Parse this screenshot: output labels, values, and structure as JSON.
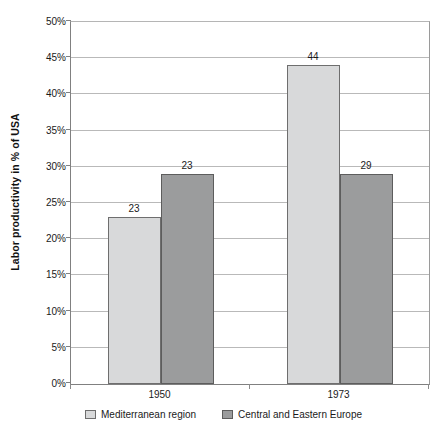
{
  "chart_data": {
    "type": "bar",
    "title": "",
    "subtitle": "",
    "xlabel": "",
    "ylabel": "Labor productivity in % of USA",
    "categories": [
      "1950",
      "1973"
    ],
    "series": [
      {
        "name": "Mediterranean region",
        "values": [
          23,
          44
        ],
        "color": "#d8d9da"
      },
      {
        "name": "Central and Eastern Europe",
        "values": [
          29,
          29
        ],
        "color": "#9b9c9d"
      }
    ],
    "ylim": [
      0,
      50
    ],
    "ytick_step": 5,
    "ytick_labels": [
      "0%",
      "5%",
      "10%",
      "15%",
      "20%",
      "25%",
      "30%",
      "35%",
      "40%",
      "45%",
      "50%"
    ],
    "ytick_values": [
      0,
      5,
      10,
      15,
      20,
      25,
      30,
      35,
      40,
      45,
      50
    ],
    "data_labels": [
      [
        "23",
        "23"
      ],
      [
        "44",
        "29"
      ]
    ],
    "grid": true,
    "legend_position": "bottom",
    "value_suffix": "%"
  },
  "axis": {
    "y_title": "Labor productivity in % of USA"
  },
  "legend": {
    "items": [
      {
        "label": "Mediterranean region"
      },
      {
        "label": "Central and Eastern Europe"
      }
    ]
  },
  "colors": {
    "series_light": "#d8d9da",
    "series_dark": "#9b9c9d",
    "gridline": "#b9b9b9",
    "axis": "#808080",
    "text": "#1a1a1a"
  }
}
